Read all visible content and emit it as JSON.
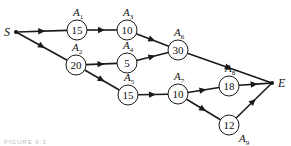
{
  "diagram": {
    "type": "activity-network",
    "start": {
      "id": "S",
      "label": "S",
      "x": 16,
      "y": 32
    },
    "end": {
      "id": "E",
      "label": "E",
      "x": 272,
      "y": 83
    },
    "nodes": [
      {
        "id": "A1",
        "label": "A",
        "sub": "1",
        "value": "15",
        "x": 77,
        "y": 30
      },
      {
        "id": "A2",
        "label": "A",
        "sub": "2",
        "value": "20",
        "x": 76,
        "y": 65
      },
      {
        "id": "A3",
        "label": "A",
        "sub": "3",
        "value": "10",
        "x": 127,
        "y": 30
      },
      {
        "id": "A4",
        "label": "A",
        "sub": "4",
        "value": "5",
        "x": 127,
        "y": 63
      },
      {
        "id": "A5",
        "label": "A",
        "sub": "5",
        "value": "15",
        "x": 128,
        "y": 95
      },
      {
        "id": "A6",
        "label": "A",
        "sub": "6",
        "value": "30",
        "x": 178,
        "y": 50
      },
      {
        "id": "A7",
        "label": "A",
        "sub": "7",
        "value": "10",
        "x": 178,
        "y": 94
      },
      {
        "id": "A8",
        "label": "A",
        "sub": "8",
        "value": "18",
        "x": 229,
        "y": 86
      },
      {
        "id": "A9",
        "label": "A",
        "sub": "9",
        "value": "12",
        "x": 229,
        "y": 125
      }
    ],
    "edges": [
      [
        "S",
        "A1"
      ],
      [
        "S",
        "A2"
      ],
      [
        "A1",
        "A3"
      ],
      [
        "A2",
        "A4"
      ],
      [
        "A2",
        "A5"
      ],
      [
        "A3",
        "A6"
      ],
      [
        "A4",
        "A6"
      ],
      [
        "A6",
        "E"
      ],
      [
        "A5",
        "A7"
      ],
      [
        "A7",
        "A8"
      ],
      [
        "A7",
        "A9"
      ],
      [
        "A8",
        "E"
      ],
      [
        "A9",
        "E"
      ]
    ],
    "caption": "FIGURE 9.3"
  }
}
